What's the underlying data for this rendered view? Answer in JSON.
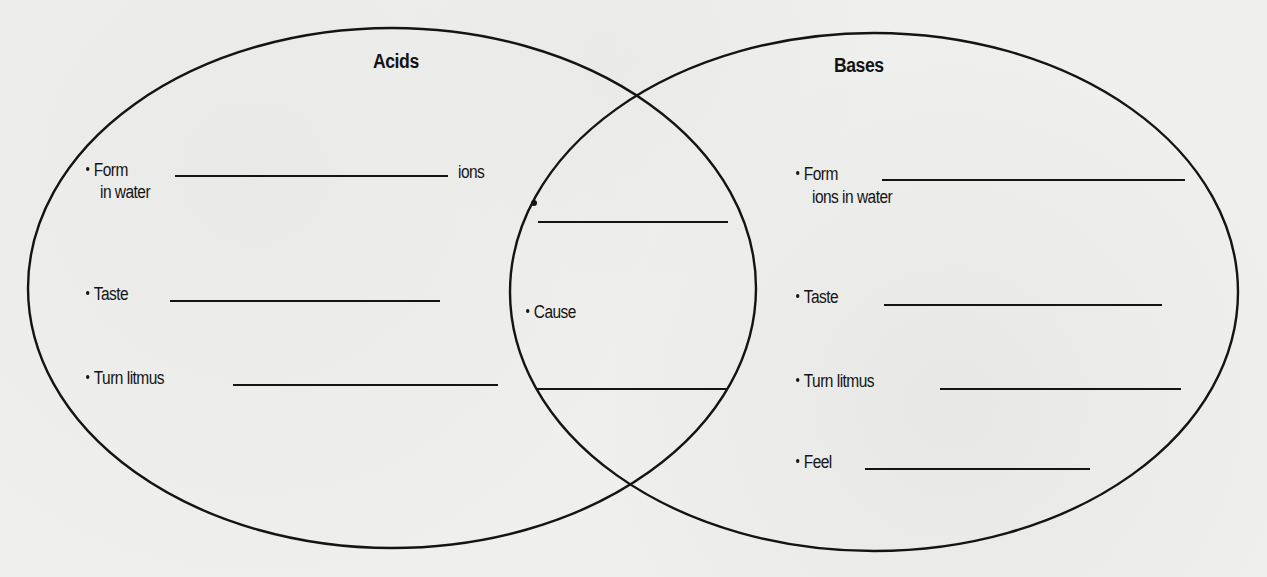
{
  "diagram": {
    "type": "venn",
    "colors": {
      "ink": "#141414",
      "paper": "#efefee"
    },
    "left_set": {
      "title": "Acids",
      "items": [
        {
          "label_line1": "Form",
          "label_line2": "in water",
          "suffix": "ions",
          "blank": ""
        },
        {
          "label": "Taste",
          "blank": ""
        },
        {
          "label": "Turn litmus",
          "blank": ""
        }
      ]
    },
    "overlap": {
      "items": [
        {
          "label": "",
          "blank": ""
        },
        {
          "label": "Cause",
          "blank": ""
        }
      ]
    },
    "right_set": {
      "title": "Bases",
      "items": [
        {
          "label_line1": "Form",
          "label_line2": "ions in water",
          "blank": ""
        },
        {
          "label": "Taste",
          "blank": ""
        },
        {
          "label": "Turn litmus",
          "blank": ""
        },
        {
          "label": "Feel",
          "blank": ""
        }
      ]
    }
  }
}
